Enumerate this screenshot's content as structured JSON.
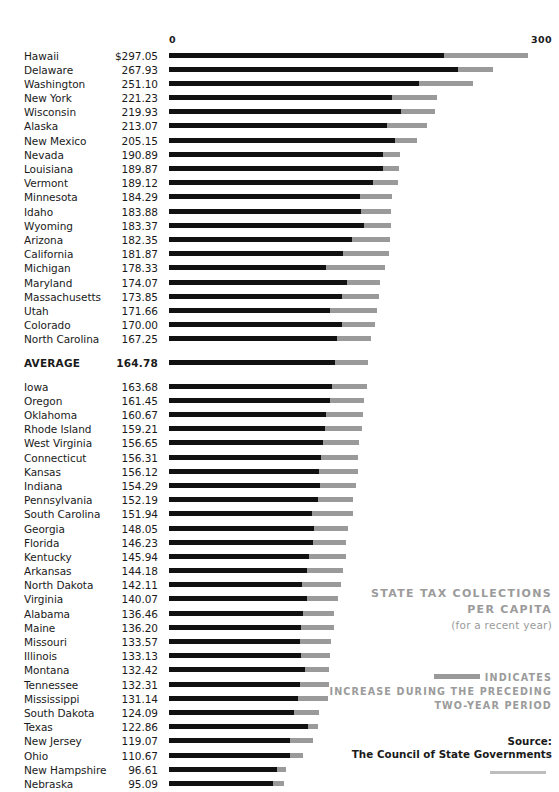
{
  "chart_data": {
    "type": "bar",
    "title": "STATE TAX COLLECTIONS PER CAPITA",
    "subtitle": "(for a recent year)",
    "xlabel": "",
    "ylabel": "",
    "xlim": [
      0,
      300
    ],
    "axis_ticks": [
      "0",
      "300"
    ],
    "grid": false,
    "orientation": "horizontal",
    "legend_position": "bottom-right",
    "series": [
      {
        "name": "Tax collections per capita (base)",
        "color": "#111111"
      },
      {
        "name": "Increase during the preceding two-year period",
        "color": "#9a9a9a"
      }
    ],
    "categories": [
      "Hawaii",
      "Delaware",
      "Washington",
      "New York",
      "Wisconsin",
      "Alaska",
      "New Mexico",
      "Nevada",
      "Louisiana",
      "Vermont",
      "Minnesota",
      "Idaho",
      "Wyoming",
      "Arizona",
      "California",
      "Michigan",
      "Maryland",
      "Massachusetts",
      "Utah",
      "Colorado",
      "North Carolina",
      "AVERAGE",
      "Iowa",
      "Oregon",
      "Oklahoma",
      "Rhode Island",
      "West Virginia",
      "Connecticut",
      "Kansas",
      "Indiana",
      "Pennsylvania",
      "South Carolina",
      "Georgia",
      "Florida",
      "Kentucky",
      "Arkansas",
      "North Dakota",
      "Virginia",
      "Alabama",
      "Maine",
      "Missouri",
      "Illinois",
      "Montana",
      "Tennessee",
      "Mississippi",
      "South Dakota",
      "Texas",
      "New Jersey",
      "Ohio",
      "New Hampshire",
      "Nebraska"
    ],
    "values": [
      297.05,
      267.93,
      251.1,
      221.23,
      219.93,
      213.07,
      205.15,
      190.89,
      189.87,
      189.12,
      184.29,
      183.88,
      183.37,
      182.35,
      181.87,
      178.33,
      174.07,
      173.85,
      171.66,
      170.0,
      167.25,
      164.78,
      163.68,
      161.45,
      160.67,
      159.21,
      156.65,
      156.31,
      156.12,
      154.29,
      152.19,
      151.94,
      148.05,
      146.23,
      145.94,
      144.18,
      142.11,
      140.07,
      136.46,
      136.2,
      133.57,
      133.13,
      132.42,
      132.31,
      131.14,
      124.09,
      122.86,
      119.07,
      110.67,
      96.61,
      95.09
    ],
    "base_values": [
      227.0,
      239.0,
      207.0,
      184.0,
      192.0,
      180.0,
      187.0,
      177.0,
      177.0,
      169.0,
      158.0,
      159.0,
      161.0,
      151.0,
      144.0,
      130.0,
      147.0,
      143.0,
      133.0,
      143.0,
      139.0,
      137.0,
      135.0,
      133.0,
      130.0,
      129.0,
      127.0,
      126.0,
      124.0,
      125.0,
      123.0,
      118.0,
      120.0,
      119.0,
      116.0,
      114.0,
      110.0,
      114.0,
      111.0,
      109.0,
      108.0,
      109.0,
      112.0,
      108.0,
      107.0,
      103.0,
      115.0,
      100.0,
      100.0,
      89.0,
      86.0
    ]
  },
  "axis": {
    "min_label": "0",
    "max_label": "300"
  },
  "rows": [
    {
      "name": "Hawaii",
      "value": "$297.05",
      "total": 297.05,
      "base": 227.0
    },
    {
      "name": "Delaware",
      "value": "267.93",
      "total": 267.93,
      "base": 239.0
    },
    {
      "name": "Washington",
      "value": "251.10",
      "total": 251.1,
      "base": 207.0
    },
    {
      "name": "New York",
      "value": "221.23",
      "total": 221.23,
      "base": 184.0
    },
    {
      "name": "Wisconsin",
      "value": "219.93",
      "total": 219.93,
      "base": 192.0
    },
    {
      "name": "Alaska",
      "value": "213.07",
      "total": 213.07,
      "base": 180.0
    },
    {
      "name": "New Mexico",
      "value": "205.15",
      "total": 205.15,
      "base": 187.0
    },
    {
      "name": "Nevada",
      "value": "190.89",
      "total": 190.89,
      "base": 177.0
    },
    {
      "name": "Louisiana",
      "value": "189.87",
      "total": 189.87,
      "base": 177.0
    },
    {
      "name": "Vermont",
      "value": "189.12",
      "total": 189.12,
      "base": 169.0
    },
    {
      "name": "Minnesota",
      "value": "184.29",
      "total": 184.29,
      "base": 158.0
    },
    {
      "name": "Idaho",
      "value": "183.88",
      "total": 183.88,
      "base": 159.0
    },
    {
      "name": "Wyoming",
      "value": "183.37",
      "total": 183.37,
      "base": 161.0
    },
    {
      "name": "Arizona",
      "value": "182.35",
      "total": 182.35,
      "base": 151.0
    },
    {
      "name": "California",
      "value": "181.87",
      "total": 181.87,
      "base": 144.0
    },
    {
      "name": "Michigan",
      "value": "178.33",
      "total": 178.33,
      "base": 130.0
    },
    {
      "name": "Maryland",
      "value": "174.07",
      "total": 174.07,
      "base": 147.0
    },
    {
      "name": "Massachusetts",
      "value": "173.85",
      "total": 173.85,
      "base": 143.0
    },
    {
      "name": "Utah",
      "value": "171.66",
      "total": 171.66,
      "base": 133.0
    },
    {
      "name": "Colorado",
      "value": "170.00",
      "total": 170.0,
      "base": 143.0
    },
    {
      "name": "North Carolina",
      "value": "167.25",
      "total": 167.25,
      "base": 139.0
    },
    {
      "name": "AVERAGE",
      "value": "164.78",
      "total": 164.78,
      "base": 137.0,
      "average": true
    },
    {
      "name": "Iowa",
      "value": "163.68",
      "total": 163.68,
      "base": 135.0
    },
    {
      "name": "Oregon",
      "value": "161.45",
      "total": 161.45,
      "base": 133.0
    },
    {
      "name": "Oklahoma",
      "value": "160.67",
      "total": 160.67,
      "base": 130.0
    },
    {
      "name": "Rhode Island",
      "value": "159.21",
      "total": 159.21,
      "base": 129.0
    },
    {
      "name": "West Virginia",
      "value": "156.65",
      "total": 156.65,
      "base": 127.0
    },
    {
      "name": "Connecticut",
      "value": "156.31",
      "total": 156.31,
      "base": 126.0
    },
    {
      "name": "Kansas",
      "value": "156.12",
      "total": 156.12,
      "base": 124.0
    },
    {
      "name": "Indiana",
      "value": "154.29",
      "total": 154.29,
      "base": 125.0
    },
    {
      "name": "Pennsylvania",
      "value": "152.19",
      "total": 152.19,
      "base": 123.0
    },
    {
      "name": "South Carolina",
      "value": "151.94",
      "total": 151.94,
      "base": 118.0
    },
    {
      "name": "Georgia",
      "value": "148.05",
      "total": 148.05,
      "base": 120.0
    },
    {
      "name": "Florida",
      "value": "146.23",
      "total": 146.23,
      "base": 119.0
    },
    {
      "name": "Kentucky",
      "value": "145.94",
      "total": 145.94,
      "base": 116.0
    },
    {
      "name": "Arkansas",
      "value": "144.18",
      "total": 144.18,
      "base": 114.0
    },
    {
      "name": "North Dakota",
      "value": "142.11",
      "total": 142.11,
      "base": 110.0
    },
    {
      "name": "Virginia",
      "value": "140.07",
      "total": 140.07,
      "base": 114.0
    },
    {
      "name": "Alabama",
      "value": "136.46",
      "total": 136.46,
      "base": 111.0
    },
    {
      "name": "Maine",
      "value": "136.20",
      "total": 136.2,
      "base": 109.0
    },
    {
      "name": "Missouri",
      "value": "133.57",
      "total": 133.57,
      "base": 108.0
    },
    {
      "name": "Illinois",
      "value": "133.13",
      "total": 133.13,
      "base": 109.0
    },
    {
      "name": "Montana",
      "value": "132.42",
      "total": 132.42,
      "base": 112.0
    },
    {
      "name": "Tennessee",
      "value": "132.31",
      "total": 132.31,
      "base": 108.0
    },
    {
      "name": "Mississippi",
      "value": "131.14",
      "total": 131.14,
      "base": 107.0
    },
    {
      "name": "South Dakota",
      "value": "124.09",
      "total": 124.09,
      "base": 103.0
    },
    {
      "name": "Texas",
      "value": "122.86",
      "total": 122.86,
      "base": 115.0
    },
    {
      "name": "New Jersey",
      "value": "119.07",
      "total": 119.07,
      "base": 100.0
    },
    {
      "name": "Ohio",
      "value": "110.67",
      "total": 110.67,
      "base": 100.0
    },
    {
      "name": "New Hampshire",
      "value": "96.61",
      "total": 96.61,
      "base": 89.0
    },
    {
      "name": "Nebraska",
      "value": "95.09",
      "total": 95.09,
      "base": 86.0
    }
  ],
  "caption": {
    "title_line1": "STATE TAX COLLECTIONS",
    "title_line2": "PER CAPITA",
    "subtitle": "(for a recent year)"
  },
  "legend": {
    "indicates": "INDICATES",
    "line2": "INCREASE DURING THE PRECEDING",
    "line3": "TWO-YEAR PERIOD",
    "swatch_color": "#9a9a9a"
  },
  "source": {
    "label": "Source:",
    "name": "The Council of State Governments"
  }
}
